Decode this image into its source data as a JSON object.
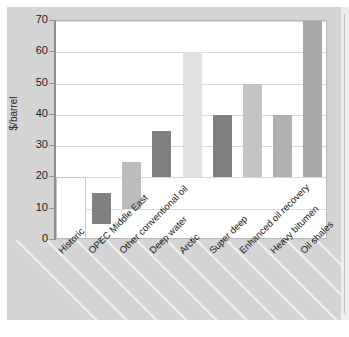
{
  "chart_data": {
    "type": "bar",
    "bar_style": "floating-range",
    "title": "",
    "subtitle": "",
    "xlabel": "",
    "ylabel": "$/barrel",
    "ylim": [
      0,
      70
    ],
    "ytick_step": 10,
    "yticks": [
      "0",
      "10",
      "20",
      "30",
      "40",
      "50",
      "60",
      "70"
    ],
    "grid": true,
    "grid_axis": "y",
    "legend": false,
    "legend_position": "none",
    "categories": [
      "Historic",
      "OPEC Middle East",
      "Other conventional oil",
      "Deep water",
      "Arctic",
      "Super deep",
      "Enhanced oil recovery",
      "Heavy bitumen",
      "Oil shales"
    ],
    "bars": [
      {
        "category": "Historic",
        "low": 0,
        "high": 20,
        "fill": "#ffffff",
        "outline": "#c6c6c6",
        "outlined": true,
        "full_slot": true
      },
      {
        "category": "OPEC Middle East",
        "low": 5,
        "high": 15,
        "fill": "#808080",
        "outline": "#808080",
        "outlined": false,
        "full_slot": false
      },
      {
        "category": "Other conventional oil",
        "low": 10,
        "high": 25,
        "fill": "#bcbcbc",
        "outline": "#bcbcbc",
        "outlined": false,
        "full_slot": false
      },
      {
        "category": "Deep water",
        "low": 20,
        "high": 35,
        "fill": "#808080",
        "outline": "#808080",
        "outlined": false,
        "full_slot": false
      },
      {
        "category": "Arctic",
        "low": 20,
        "high": 60,
        "fill": "#e2e2e2",
        "outline": "#e2e2e2",
        "outlined": false,
        "full_slot": false
      },
      {
        "category": "Super deep",
        "low": 20,
        "high": 40,
        "fill": "#808080",
        "outline": "#808080",
        "outlined": false,
        "full_slot": false
      },
      {
        "category": "Enhanced oil recovery",
        "low": 20,
        "high": 50,
        "fill": "#c4c4c4",
        "outline": "#c4c4c4",
        "outlined": false,
        "full_slot": false
      },
      {
        "category": "Heavy bitumen",
        "low": 20,
        "high": 40,
        "fill": "#b0b0b0",
        "outline": "#b0b0b0",
        "outlined": false,
        "full_slot": false
      },
      {
        "category": "Oil shales",
        "low": 20,
        "high": 70,
        "fill": "#a8a8a8",
        "outline": "#a8a8a8",
        "outlined": false,
        "full_slot": false
      }
    ],
    "values": [
      20,
      15,
      25,
      35,
      60,
      40,
      50,
      40,
      70
    ],
    "lows": [
      0,
      5,
      10,
      20,
      20,
      20,
      20,
      20,
      20
    ]
  },
  "colors": {
    "panel_background": "#d4d4d4",
    "plot_background": "#ffffff",
    "gridline": "#d9d9d9",
    "axis": "#8e8e8e",
    "text": "#1c1c1c",
    "stripe": "#f2f2f2"
  }
}
